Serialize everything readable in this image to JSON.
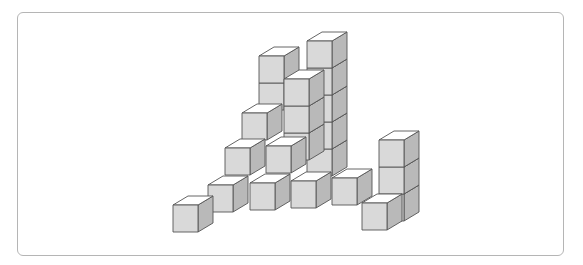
{
  "figure": {
    "label": "",
    "cube": {
      "width": 25,
      "height": 27,
      "depth_dx": 15,
      "depth_dy": -9
    },
    "colors": {
      "top": "#ffffff",
      "front": "#d9d9d9",
      "side": "#b9b9b9",
      "edge": "#555555",
      "frame": "#b5b5b5"
    },
    "cubes": [
      {
        "x": 307,
        "y": 149
      },
      {
        "x": 307,
        "y": 122
      },
      {
        "x": 307,
        "y": 95
      },
      {
        "x": 307,
        "y": 68
      },
      {
        "x": 307,
        "y": 41
      },
      {
        "x": 259,
        "y": 83
      },
      {
        "x": 259,
        "y": 56
      },
      {
        "x": 284,
        "y": 133
      },
      {
        "x": 284,
        "y": 106
      },
      {
        "x": 284,
        "y": 79
      },
      {
        "x": 242,
        "y": 113
      },
      {
        "x": 266,
        "y": 146
      },
      {
        "x": 225,
        "y": 148
      },
      {
        "x": 332,
        "y": 178
      },
      {
        "x": 291,
        "y": 181
      },
      {
        "x": 250,
        "y": 183
      },
      {
        "x": 208,
        "y": 185
      },
      {
        "x": 173,
        "y": 205
      },
      {
        "x": 379,
        "y": 194
      },
      {
        "x": 379,
        "y": 167
      },
      {
        "x": 379,
        "y": 140
      },
      {
        "x": 362,
        "y": 203
      }
    ]
  }
}
